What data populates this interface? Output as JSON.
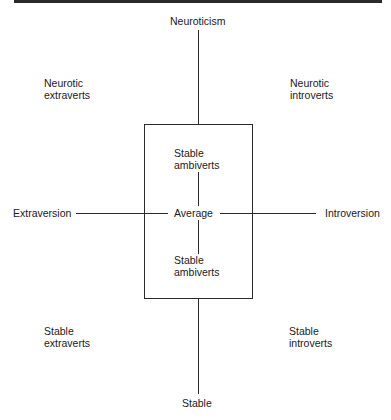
{
  "diagram": {
    "axes": {
      "top": "Neuroticism",
      "bottom": "Stable",
      "left": "Extraversion",
      "right": "Introversion",
      "center": "Average"
    },
    "quadrants": {
      "top_left": [
        "Neurotic",
        "extraverts"
      ],
      "top_right": [
        "Neurotic",
        "introverts"
      ],
      "bottom_left": [
        "Stable",
        "extraverts"
      ],
      "bottom_right": [
        "Stable",
        "introverts"
      ]
    },
    "center_box": {
      "upper": [
        "Stable",
        "ambiverts"
      ],
      "lower": [
        "Stable",
        "ambiverts"
      ]
    },
    "line_color": "#2a2a2a"
  }
}
